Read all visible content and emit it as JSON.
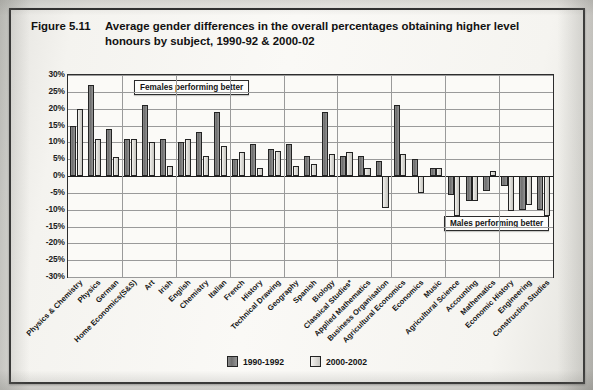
{
  "figure": {
    "number": "Figure 5.11",
    "title": "Average gender differences in the overall percentages obtaining higher level honours by subject, 1990-92 & 2000-02"
  },
  "annotations": {
    "females": "Females performing better",
    "males": "Males performing better"
  },
  "legend": {
    "series1": "1990-1992",
    "series2": "2000-2002"
  },
  "colors": {
    "series1": "#6f6f6f",
    "series2": "#dcdbd6",
    "axis": "#232323",
    "grid": "#9a9a9a"
  },
  "chart_data": {
    "type": "bar",
    "title": "Average gender differences in the overall percentages obtaining higher level honours by subject, 1990-92 & 2000-02",
    "xlabel": "",
    "ylabel": "",
    "ylim": [
      -30,
      30
    ],
    "ytick_labels": [
      "30%",
      "25%",
      "20%",
      "15%",
      "10%",
      "5%",
      "0%",
      "-5%",
      "-10%",
      "-15%",
      "-20%",
      "-25%",
      "-30%"
    ],
    "yticks": [
      30,
      25,
      20,
      15,
      10,
      5,
      0,
      -5,
      -10,
      -15,
      -20,
      -25,
      -30
    ],
    "grid": true,
    "legend_position": "bottom",
    "categories": [
      "Physics & Chemistry",
      "Physics",
      "German",
      "Home Economics(S&S)",
      "Art",
      "Irish",
      "English",
      "Chemistry",
      "Italian",
      "French",
      "History",
      "Technical Drawing",
      "Geography",
      "Spanish",
      "Biology",
      "Classical Studies*",
      "Applied Mathematics",
      "Business Organisation",
      "Agricultural Economics",
      "Economics",
      "Music",
      "Agricultural Science",
      "Accounting",
      "Mathematics",
      "Economic History",
      "Engineering",
      "Construction Studies"
    ],
    "series": [
      {
        "name": "1990-1992",
        "values": [
          15,
          27,
          14,
          11,
          21,
          11,
          10,
          13,
          19,
          5,
          9.5,
          8,
          9.5,
          6,
          19,
          6,
          6,
          4.5,
          21,
          5,
          2.5,
          -5.5,
          -7.5,
          -4.5,
          -3,
          -10,
          -10
        ]
      },
      {
        "name": "2000-2002",
        "values": [
          20,
          11,
          5.5,
          11,
          10,
          3,
          11,
          6,
          9,
          7,
          2.5,
          7.5,
          3,
          3.5,
          6.5,
          7,
          2.5,
          -9.5,
          6.5,
          -5,
          2.5,
          -12,
          -7.5,
          1.5,
          -10.5,
          -8.5,
          -12
        ]
      }
    ]
  }
}
